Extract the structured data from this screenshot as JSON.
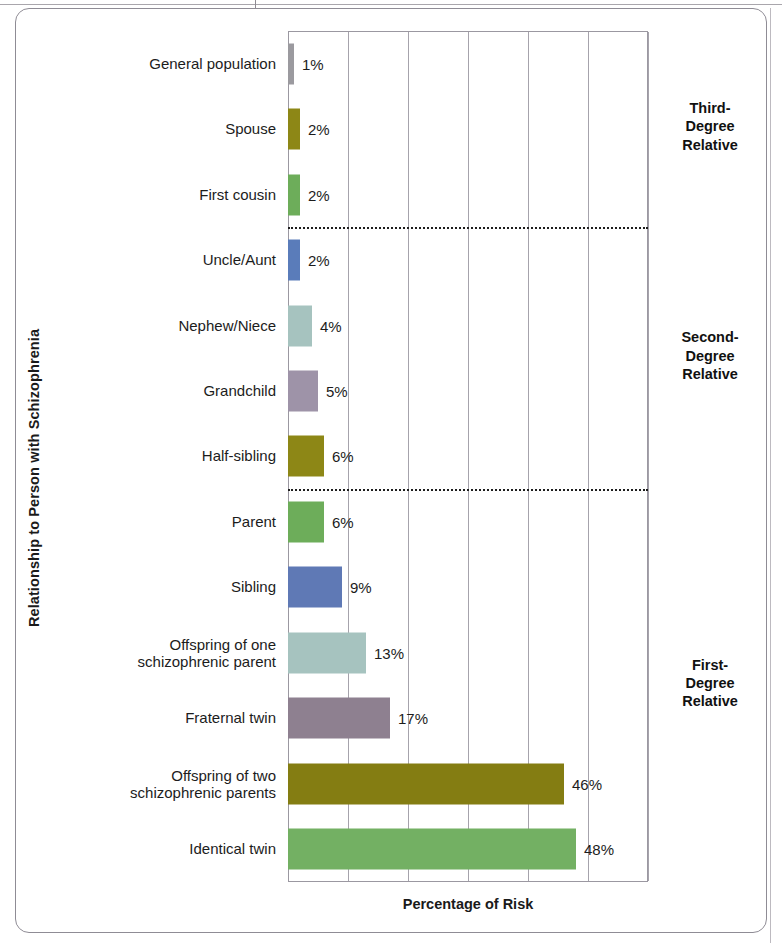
{
  "chart_data": {
    "type": "bar",
    "orientation": "horizontal",
    "title": "",
    "xlabel": "Percentage of Risk",
    "ylabel": "Relationship to Person with Schizophrenia",
    "xlim": [
      0,
      60
    ],
    "grid": true,
    "gridline_values": [
      10,
      20,
      30,
      40,
      50,
      60
    ],
    "axis_tick_labels": [],
    "legend": "none",
    "categories": [
      "General population",
      "Spouse",
      "First cousin",
      "Uncle/Aunt",
      "Nephew/Niece",
      "Grandchild",
      "Half-sibling",
      "Parent",
      "Sibling",
      "Offspring of one\nschizophrenic parent",
      "Fraternal twin",
      "Offspring of two\nschizophrenic parents",
      "Identical twin"
    ],
    "values": [
      1,
      2,
      2,
      2,
      4,
      5,
      6,
      6,
      9,
      13,
      17,
      46,
      48
    ],
    "value_labels": [
      "1%",
      "2%",
      "2%",
      "2%",
      "4%",
      "5%",
      "6%",
      "6%",
      "9%",
      "13%",
      "17%",
      "46%",
      "48%"
    ],
    "bar_colors": [
      "#9b9a9f",
      "#8d8716",
      "#6dad5a",
      "#5a7cba",
      "#a6c3bf",
      "#9e93a8",
      "#8d8716",
      "#6dad5a",
      "#5f79b5",
      "#a6c3bf",
      "#8e8090",
      "#847d12",
      "#73b063"
    ],
    "annotations": [
      {
        "text": "Third-\nDegree\nRelative",
        "applies_to": [
          "General population",
          "Spouse",
          "First cousin"
        ]
      },
      {
        "text": "Second-\nDegree\nRelative",
        "applies_to": [
          "Uncle/Aunt",
          "Nephew/Niece",
          "Grandchild",
          "Half-sibling"
        ]
      },
      {
        "text": "First-\nDegree\nRelative",
        "applies_to": [
          "Parent",
          "Sibling",
          "Offspring of one schizophrenic parent",
          "Fraternal twin",
          "Offspring of two schizophrenic parents",
          "Identical twin"
        ]
      }
    ],
    "group_dividers_after": [
      "First cousin",
      "Half-sibling"
    ]
  },
  "axes": {
    "y_title": "Relationship to Person with Schizophrenia",
    "x_title": "Percentage of Risk"
  },
  "groups": [
    {
      "label": "Third-\nDegree\nRelative"
    },
    {
      "label": "Second-\nDegree\nRelative"
    },
    {
      "label": "First-\nDegree\nRelative"
    }
  ],
  "colors": {
    "frame": "#8f8c95",
    "plot_border": "#9b98a1",
    "gridline": "#a6a3ac",
    "divider": "#1d1d1d",
    "text": "#1c1c1c"
  }
}
